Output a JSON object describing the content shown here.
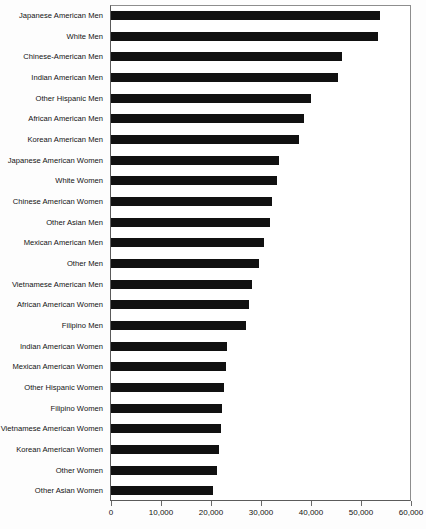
{
  "chart_data": {
    "type": "bar",
    "orientation": "horizontal",
    "title": "",
    "subtitle": "",
    "xlabel": "",
    "ylabel": "",
    "xlim": [
      0,
      60000
    ],
    "grid": false,
    "legend": false,
    "legend_position": "none",
    "bar_color": "#111111",
    "xticks": [
      0,
      10000,
      20000,
      30000,
      40000,
      50000,
      60000
    ],
    "xticklabels": [
      "0",
      "10,000",
      "20,000",
      "30,000",
      "40,000",
      "50,000",
      "60,000"
    ],
    "categories": [
      "Japanese American Men",
      "White Men",
      "Chinese-American Men",
      "Indian American Men",
      "Other Hispanic Men",
      "African American Men",
      "Korean American Men",
      "Japanese American Women",
      "White Women",
      "Chinese American Women",
      "Other Asian Men",
      "Mexican American Men",
      "Other Men",
      "Vietnamese American Men",
      "African American Women",
      "Filipino Men",
      "Indian American Women",
      "Mexican American Women",
      "Other Hispanic Women",
      "Filipino Women",
      "Vietnamese American Women",
      "Korean American Women",
      "Other Women",
      "Other Asian Women"
    ],
    "values": [
      53800,
      53300,
      46200,
      45400,
      39900,
      38500,
      37600,
      33500,
      33100,
      32100,
      31700,
      30500,
      29600,
      28100,
      27600,
      26900,
      23200,
      22900,
      22500,
      22200,
      21900,
      21600,
      21100,
      20300
    ]
  }
}
